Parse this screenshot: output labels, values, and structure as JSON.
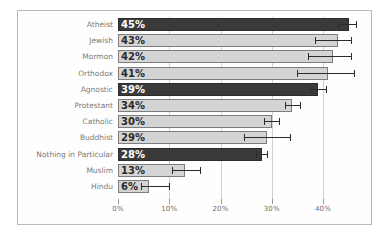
{
  "chart_data": {
    "type": "bar",
    "orientation": "horizontal",
    "title": "",
    "subtitle": "",
    "xlabel": "",
    "ylabel": "",
    "xlim": [
      0,
      46
    ],
    "ylim": null,
    "grid": true,
    "legend": null,
    "legend_position": "none",
    "xticks": [
      "0%",
      "10%",
      "20%",
      "30%",
      "40%"
    ],
    "xtick_values": [
      0,
      10,
      20,
      30,
      40
    ],
    "categories": [
      "Atheist",
      "Jewish",
      "Mormon",
      "Orthodox",
      "Agnostic",
      "Protestant",
      "Catholic",
      "Buddhist",
      "Nothing in Particular",
      "Muslim",
      "Hindu"
    ],
    "values": [
      45,
      43,
      42,
      41,
      39,
      34,
      30,
      29,
      28,
      13,
      6
    ],
    "data_labels": [
      "45%",
      "43%",
      "42%",
      "41%",
      "39%",
      "34%",
      "30%",
      "29%",
      "28%",
      "13%",
      "6%"
    ],
    "bar_styles": [
      "dark",
      "light",
      "light",
      "light",
      "dark",
      "light",
      "light",
      "light",
      "dark",
      "light",
      "light"
    ],
    "error_low": [
      43.0,
      38.5,
      37.0,
      35.0,
      37.5,
      32.5,
      28.5,
      24.5,
      27.0,
      10.5,
      4.5
    ],
    "error_high": [
      46.5,
      45.5,
      45.5,
      46.0,
      40.5,
      35.5,
      31.5,
      33.5,
      29.0,
      16.0,
      10.0
    ],
    "colors": {
      "bar_dark": "#3a3a3a",
      "bar_light": "#d4d4d4",
      "bar_outline": "#6f6f6f",
      "error_bar": "#2b2b2b",
      "gridline": "#d0d0d0",
      "tick_label": "#6d6d6d",
      "category_label": "#7a7a7a",
      "frame": "#b9b9b9",
      "background": "#ffffff"
    }
  }
}
